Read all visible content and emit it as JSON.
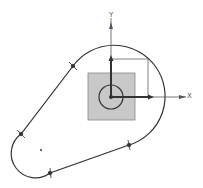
{
  "diagram": {
    "type": "cad-sketch",
    "axes": {
      "x_label": "X",
      "y_label": "Y",
      "origin": [
        111,
        97
      ]
    },
    "profile": {
      "large_arc_center": [
        111,
        97
      ],
      "large_arc_radius": 51,
      "small_arc_center": [
        41,
        150
      ],
      "small_arc_radius": 24,
      "tangent_points": [
        [
          73,
          66
        ],
        [
          21,
          134
        ],
        [
          50,
          173
        ],
        [
          129,
          145
        ]
      ]
    },
    "base_square": {
      "x": 88,
      "y": 73,
      "size": 47,
      "fill": "#c8c8c8"
    },
    "hole_circle": {
      "center": [
        111,
        97
      ],
      "radius": 12
    },
    "dimension_box": {
      "x": 111,
      "y": 59,
      "w": 37,
      "h": 38
    },
    "colors": {
      "line": "#333333",
      "axis": "#555555",
      "square": "#c8c8c8"
    }
  }
}
